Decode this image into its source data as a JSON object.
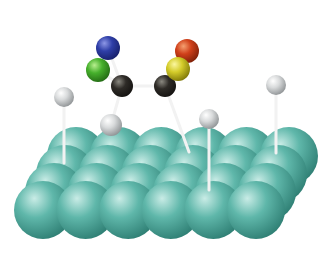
{
  "diagram": {
    "title": "Adsorbed molecule on metal surface slab",
    "background": "#ffffff",
    "colors": {
      "surface": "#5fb7aa",
      "surface_shadow": "#2f7f74",
      "surface_highlight": "#c9ece6",
      "hydrogen": "#d8dadb",
      "hydrogen_shadow": "#8e9294",
      "carbon": "#2e2b27",
      "carbon_highlight": "#8a8880",
      "nitrogen": "#2f3fa8",
      "chlorine": "#46b02c",
      "oxygen": "#d0401a",
      "sulfur": "#d4cc2a",
      "bond": "#f2f2f2"
    },
    "surface": {
      "columns": 6,
      "rows": 4,
      "front_origin": [
        43,
        210
      ],
      "column_spacing": 42.6,
      "row_offset": [
        11,
        -18
      ],
      "radius": 29
    },
    "atoms": [
      {
        "id": "N",
        "element": "nitrogen",
        "x": 108,
        "y": 48,
        "r": 12
      },
      {
        "id": "Cl",
        "element": "chlorine",
        "x": 98,
        "y": 70,
        "r": 12
      },
      {
        "id": "C1",
        "element": "carbon",
        "x": 122,
        "y": 86,
        "r": 11
      },
      {
        "id": "C2",
        "element": "carbon",
        "x": 165,
        "y": 86,
        "r": 11
      },
      {
        "id": "O",
        "element": "oxygen",
        "x": 187,
        "y": 51,
        "r": 12
      },
      {
        "id": "S",
        "element": "sulfur",
        "x": 178,
        "y": 69,
        "r": 12
      },
      {
        "id": "H1",
        "element": "hydrogen",
        "x": 64,
        "y": 97,
        "r": 10
      },
      {
        "id": "H2",
        "element": "hydrogen",
        "x": 111,
        "y": 125,
        "r": 11
      },
      {
        "id": "H3",
        "element": "hydrogen",
        "x": 209,
        "y": 119,
        "r": 10
      },
      {
        "id": "H4",
        "element": "hydrogen",
        "x": 276,
        "y": 85,
        "r": 10
      }
    ],
    "bonds": [
      {
        "from": "N",
        "to": "C1"
      },
      {
        "from": "Cl",
        "to": "C1"
      },
      {
        "from": "C1",
        "to": "C2"
      },
      {
        "from": "C1",
        "to": "H2"
      },
      {
        "from": "S",
        "to": "C2"
      },
      {
        "from": "O",
        "to": "S"
      }
    ],
    "tethers": [
      {
        "from": "H1",
        "to": [
          64,
          163
        ]
      },
      {
        "from": "C2",
        "to": [
          189,
          152
        ]
      },
      {
        "from": "H3",
        "to": [
          209,
          190
        ]
      },
      {
        "from": "H4",
        "to": [
          276,
          153
        ]
      }
    ]
  }
}
